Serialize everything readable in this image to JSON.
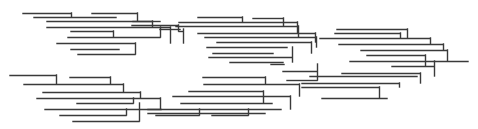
{
  "diagram": {
    "type": "dendrogram-lines",
    "width": 478,
    "height": 129,
    "background": "#ffffff",
    "stroke_color": "#3a3a3a",
    "stroke_width": 1.4,
    "horizontal_segments": [
      [
        23,
        13,
        71
      ],
      [
        34,
        17,
        116
      ],
      [
        47,
        21,
        152
      ],
      [
        47,
        27,
        170
      ],
      [
        71,
        31,
        113
      ],
      [
        68,
        37,
        160
      ],
      [
        57,
        43,
        135
      ],
      [
        71,
        49,
        119
      ],
      [
        78,
        54,
        135
      ],
      [
        92,
        13,
        137
      ],
      [
        133,
        21,
        160
      ],
      [
        132,
        25,
        178
      ],
      [
        160,
        29,
        180
      ],
      [
        179,
        31,
        183
      ],
      [
        198,
        17,
        242
      ],
      [
        253,
        18,
        283
      ],
      [
        179,
        22,
        297
      ],
      [
        176,
        26,
        298
      ],
      [
        198,
        33,
        315
      ],
      [
        205,
        37,
        316
      ],
      [
        217,
        42,
        311
      ],
      [
        207,
        47,
        287
      ],
      [
        213,
        53,
        273
      ],
      [
        209,
        57,
        292
      ],
      [
        230,
        62,
        283
      ],
      [
        337,
        29,
        407
      ],
      [
        335,
        33,
        400
      ],
      [
        320,
        38,
        430
      ],
      [
        339,
        44,
        443
      ],
      [
        361,
        50,
        447
      ],
      [
        367,
        55,
        425
      ],
      [
        350,
        61,
        468
      ],
      [
        392,
        66,
        434
      ],
      [
        342,
        73,
        420
      ],
      [
        310,
        76,
        417
      ],
      [
        302,
        83,
        399
      ],
      [
        302,
        87,
        379
      ],
      [
        322,
        98,
        387
      ],
      [
        10,
        75,
        56
      ],
      [
        70,
        77,
        110
      ],
      [
        24,
        84,
        123
      ],
      [
        43,
        92,
        140
      ],
      [
        37,
        98,
        160
      ],
      [
        77,
        103,
        133
      ],
      [
        45,
        109,
        161
      ],
      [
        60,
        115,
        126
      ],
      [
        73,
        121,
        139
      ],
      [
        271,
        64,
        284
      ],
      [
        283,
        71,
        317
      ],
      [
        287,
        80,
        317
      ],
      [
        203,
        77,
        265
      ],
      [
        204,
        84,
        299
      ],
      [
        189,
        91,
        263
      ],
      [
        173,
        96,
        290
      ],
      [
        181,
        103,
        272
      ],
      [
        148,
        109,
        281
      ],
      [
        148,
        113,
        265
      ],
      [
        156,
        115,
        199
      ],
      [
        212,
        115,
        248
      ]
    ],
    "vertical_segments": [
      [
        71,
        13,
        17
      ],
      [
        137,
        13,
        21
      ],
      [
        152,
        21,
        27
      ],
      [
        113,
        31,
        37
      ],
      [
        160,
        27,
        37
      ],
      [
        135,
        43,
        54
      ],
      [
        170,
        27,
        43
      ],
      [
        178,
        25,
        31
      ],
      [
        183,
        29,
        43
      ],
      [
        242,
        17,
        22
      ],
      [
        283,
        18,
        26
      ],
      [
        297,
        22,
        33
      ],
      [
        298,
        26,
        37
      ],
      [
        315,
        33,
        42
      ],
      [
        316,
        37,
        47
      ],
      [
        311,
        42,
        53
      ],
      [
        292,
        47,
        62
      ],
      [
        407,
        29,
        38
      ],
      [
        400,
        33,
        38
      ],
      [
        430,
        38,
        44
      ],
      [
        443,
        44,
        50
      ],
      [
        447,
        50,
        61
      ],
      [
        425,
        55,
        66
      ],
      [
        434,
        61,
        76
      ],
      [
        420,
        73,
        83
      ],
      [
        399,
        83,
        87
      ],
      [
        379,
        87,
        98
      ],
      [
        56,
        75,
        84
      ],
      [
        110,
        77,
        84
      ],
      [
        123,
        84,
        92
      ],
      [
        140,
        92,
        98
      ],
      [
        133,
        98,
        103
      ],
      [
        160,
        98,
        109
      ],
      [
        126,
        109,
        115
      ],
      [
        139,
        103,
        121
      ],
      [
        317,
        64,
        80
      ],
      [
        265,
        77,
        84
      ],
      [
        299,
        84,
        96
      ],
      [
        263,
        91,
        103
      ],
      [
        290,
        96,
        109
      ],
      [
        199,
        109,
        115
      ],
      [
        248,
        109,
        115
      ]
    ]
  }
}
